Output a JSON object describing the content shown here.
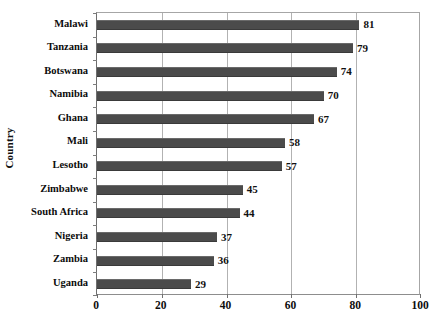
{
  "chart_data": {
    "type": "bar",
    "orientation": "horizontal",
    "title": "",
    "xlabel": "",
    "ylabel": "Country",
    "categories": [
      "Malawi",
      "Tanzania",
      "Botswana",
      "Namibia",
      "Ghana",
      "Mali",
      "Lesotho",
      "Zimbabwe",
      "South Africa",
      "Nigeria",
      "Zambia",
      "Uganda"
    ],
    "values": [
      81,
      79,
      74,
      70,
      67,
      58,
      57,
      45,
      44,
      37,
      36,
      29
    ],
    "xlim": [
      0,
      100
    ],
    "xticks": [
      0,
      20,
      40,
      60,
      80,
      100
    ],
    "xtick_labels": [
      "0",
      "20",
      "40",
      "60",
      "80",
      "100"
    ],
    "data_labels": [
      "81",
      "79",
      "74",
      "70",
      "67",
      "58",
      "57",
      "45",
      "44",
      "37",
      "36",
      "29"
    ],
    "grid": "vertical",
    "legend": "none",
    "bar_color": "#4b4b4b",
    "gridline_color": "#b2b2b2",
    "frame_color": "#9a9a9a",
    "background_color": "#ffffff"
  }
}
